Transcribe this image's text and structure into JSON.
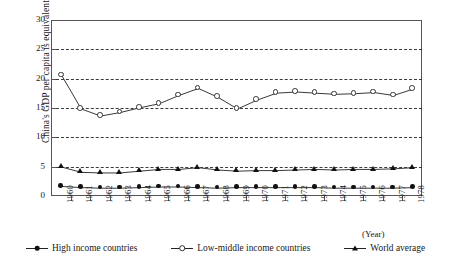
{
  "chart_data": {
    "type": "line",
    "title": "",
    "xlabel": "(Year)",
    "ylabel": "China's GDP per capita is equivalent to (%)",
    "ylim": [
      0,
      30
    ],
    "yticks": [
      0,
      5,
      10,
      15,
      20,
      25,
      30
    ],
    "gridlines": [
      5,
      10,
      15,
      20,
      25
    ],
    "grid": "horizontal-dashed",
    "legend_position": "bottom-center",
    "categories": [
      "1960",
      "1961",
      "1962",
      "1963",
      "1964",
      "1965",
      "1966",
      "1967",
      "1968",
      "1969",
      "1970",
      "1971",
      "1972",
      "1973",
      "1974",
      "1975",
      "1976",
      "1977",
      "1978"
    ],
    "series": [
      {
        "name": "High income countries",
        "marker": "filled-circle",
        "values": [
          1.8,
          1.6,
          1.5,
          1.5,
          1.6,
          1.7,
          1.7,
          1.6,
          1.5,
          1.6,
          1.6,
          1.6,
          1.6,
          1.6,
          1.5,
          1.5,
          1.5,
          1.5,
          1.6
        ]
      },
      {
        "name": "Low-middle income countries",
        "marker": "open-circle",
        "values": [
          20.7,
          15.0,
          13.8,
          14.4,
          15.2,
          15.9,
          17.3,
          18.5,
          17.0,
          15.0,
          16.5,
          17.7,
          17.9,
          17.7,
          17.5,
          17.6,
          17.8,
          17.3,
          18.4
        ]
      },
      {
        "name": "World average",
        "marker": "filled-triangle",
        "values": [
          5.1,
          4.2,
          4.1,
          4.1,
          4.4,
          4.7,
          4.7,
          5.0,
          4.6,
          4.4,
          4.5,
          4.5,
          4.6,
          4.7,
          4.6,
          4.7,
          4.7,
          4.8,
          5.0
        ]
      }
    ]
  },
  "axis": {
    "year_caption": "(Year)",
    "y_title": "China's GDP per capita is equivalent to (%)"
  },
  "legend": {
    "items": [
      {
        "label": "High income countries",
        "marker": "filled-circle-marker"
      },
      {
        "label": "Low-middle income countries",
        "marker": "open-circle-marker"
      },
      {
        "label": "World average",
        "marker": "filled-triangle-marker"
      }
    ]
  }
}
